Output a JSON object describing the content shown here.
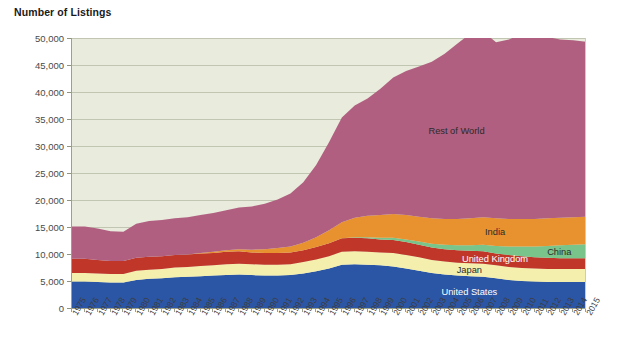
{
  "title": "Number of Listings",
  "chart_data": {
    "type": "area",
    "stacked": true,
    "title": "Number of Listings",
    "xlabel": "",
    "ylabel": "",
    "ylim": [
      0,
      50000
    ],
    "ytick_step": 5000,
    "yticks": [
      "0",
      "5,000",
      "10,000",
      "15,000",
      "20,000",
      "25,000",
      "30,000",
      "35,000",
      "40,000",
      "45,000",
      "50,000"
    ],
    "grid": true,
    "legend_position": "in-plot-labels",
    "plot_background": "#e9ebdc",
    "categories": [
      "1975",
      "1976",
      "1977",
      "1978",
      "1979",
      "1980",
      "1981",
      "1982",
      "1983",
      "1984",
      "1985",
      "1986",
      "1987",
      "1988",
      "1989",
      "1990",
      "1991",
      "1992",
      "1993",
      "1994",
      "1995",
      "1996",
      "1997",
      "1998",
      "1999",
      "2000",
      "2001",
      "2002",
      "2003",
      "2004",
      "2005",
      "2006",
      "2007",
      "2008",
      "2009",
      "2010",
      "2011",
      "2012",
      "2013",
      "2014",
      "2015"
    ],
    "series": [
      {
        "name": "United States",
        "color": "#2b56a6",
        "label_color": "#ffffff",
        "values": [
          4900,
          4900,
          4800,
          4700,
          4700,
          5200,
          5400,
          5500,
          5700,
          5800,
          5900,
          6000,
          6100,
          6200,
          6100,
          6000,
          6000,
          6100,
          6400,
          6800,
          7300,
          8000,
          8100,
          8000,
          7900,
          7700,
          7300,
          6900,
          6500,
          6200,
          6000,
          5900,
          5800,
          5500,
          5200,
          5000,
          4900,
          4800,
          4800,
          4800,
          4800
        ]
      },
      {
        "name": "Japan",
        "color": "#f5efae",
        "label_color": "#2b2b2b",
        "values": [
          1600,
          1600,
          1600,
          1600,
          1600,
          1700,
          1700,
          1700,
          1800,
          1800,
          1900,
          1900,
          2000,
          2000,
          2000,
          2000,
          2000,
          2000,
          2100,
          2200,
          2300,
          2400,
          2400,
          2400,
          2400,
          2500,
          2500,
          2500,
          2400,
          2400,
          2400,
          2400,
          2400,
          2400,
          2400,
          2400,
          2400,
          2400,
          2400,
          2400,
          2400
        ]
      },
      {
        "name": "United Kingdom",
        "color": "#c0372a",
        "label_color": "#ffffff",
        "values": [
          2600,
          2600,
          2500,
          2400,
          2400,
          2400,
          2400,
          2400,
          2300,
          2300,
          2300,
          2300,
          2300,
          2300,
          2200,
          2200,
          2200,
          2200,
          2200,
          2300,
          2400,
          2500,
          2500,
          2500,
          2400,
          2400,
          2400,
          2300,
          2300,
          2300,
          2300,
          2300,
          2300,
          2200,
          2200,
          2200,
          2100,
          2100,
          2000,
          2000,
          2000
        ]
      },
      {
        "name": "China",
        "color": "#79c48a",
        "label_color": "#2b2b2b",
        "values": [
          0,
          0,
          0,
          0,
          0,
          0,
          0,
          0,
          0,
          0,
          0,
          0,
          0,
          0,
          0,
          0,
          0,
          0,
          0,
          0,
          0,
          0,
          100,
          200,
          300,
          400,
          500,
          600,
          700,
          800,
          900,
          1000,
          1200,
          1400,
          1600,
          1800,
          2000,
          2200,
          2400,
          2500,
          2600
        ]
      },
      {
        "name": "India",
        "color": "#e8912f",
        "label_color": "#2b2b2b",
        "values": [
          0,
          0,
          0,
          0,
          0,
          0,
          0,
          0,
          0,
          0,
          100,
          200,
          300,
          400,
          500,
          700,
          900,
          1100,
          1400,
          1800,
          2400,
          3000,
          3600,
          4000,
          4200,
          4400,
          4500,
          4600,
          4700,
          4800,
          4900,
          5000,
          5100,
          5100,
          5100,
          5100,
          5100,
          5100,
          5100,
          5100,
          5100
        ]
      },
      {
        "name": "Rest of World",
        "color": "#b05f80",
        "label_color": "#2b2b2b",
        "values": [
          6000,
          6000,
          5800,
          5500,
          5400,
          6300,
          6600,
          6700,
          6800,
          6900,
          7000,
          7200,
          7400,
          7700,
          8000,
          8400,
          9000,
          9800,
          11200,
          13400,
          16300,
          19400,
          20800,
          21700,
          23400,
          25300,
          26700,
          27800,
          29000,
          30600,
          32500,
          34200,
          34400,
          32600,
          33200,
          34300,
          34800,
          33600,
          33000,
          32800,
          32400
        ]
      }
    ],
    "annotations": [
      {
        "text": "Rest of World",
        "series": "Rest of World"
      },
      {
        "text": "India",
        "series": "India"
      },
      {
        "text": "China",
        "series": "China"
      },
      {
        "text": "United Kingdom",
        "series": "United Kingdom"
      },
      {
        "text": "Japan",
        "series": "Japan"
      },
      {
        "text": "United States",
        "series": "United States"
      }
    ]
  }
}
